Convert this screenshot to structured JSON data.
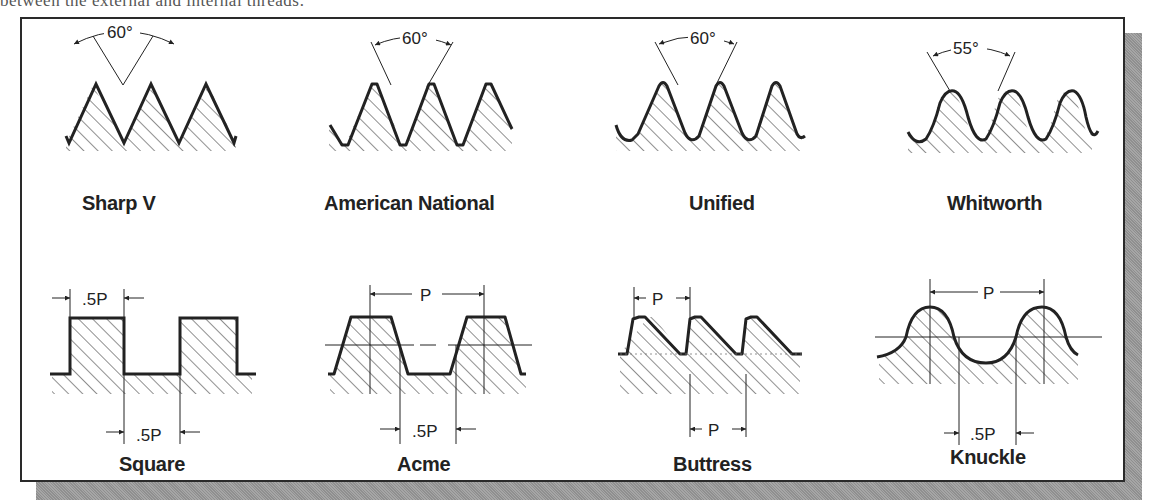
{
  "header": {
    "partial_text": "between the external and internal threads:"
  },
  "figure": {
    "threads": [
      {
        "name": "Sharp V",
        "dimension": "60°",
        "dimension_type": "angle"
      },
      {
        "name": "American National",
        "dimension": "60°",
        "dimension_type": "angle"
      },
      {
        "name": "Unified",
        "dimension": "60°",
        "dimension_type": "angle"
      },
      {
        "name": "Whitworth",
        "dimension": "55°",
        "dimension_type": "angle"
      },
      {
        "name": "Square",
        "dimensions": [
          ".5P",
          ".5P"
        ],
        "dimension_type": "pitch"
      },
      {
        "name": "Acme",
        "dimensions": [
          "P",
          ".5P"
        ],
        "dimension_type": "pitch"
      },
      {
        "name": "Buttress",
        "dimensions": [
          "P",
          "P"
        ],
        "dimension_type": "pitch"
      },
      {
        "name": "Knuckle",
        "dimensions": [
          "P",
          ".5P"
        ],
        "dimension_type": "pitch"
      }
    ]
  },
  "colors": {
    "line": "#222222",
    "frame": "#2a2a2a",
    "shadow": "#9a9a9a",
    "background": "#ffffff"
  }
}
